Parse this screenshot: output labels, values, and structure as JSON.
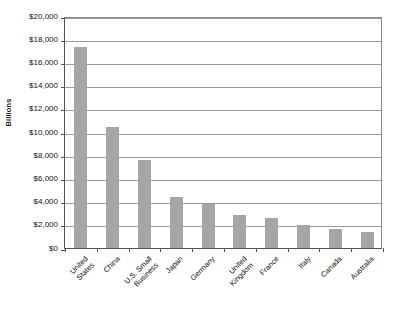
{
  "chart_data": {
    "type": "bar",
    "title": "",
    "xlabel": "",
    "ylabel": "Billions",
    "categories": [
      "United\nStates",
      "China",
      "U.S. Small\nBusiness",
      "Japan",
      "Germany",
      "United\nKingdom",
      "France",
      "Italy",
      "Canada",
      "Australia"
    ],
    "values": [
      17300,
      10400,
      7600,
      4400,
      3800,
      2850,
      2600,
      2000,
      1650,
      1350
    ],
    "ylim": [
      0,
      20000
    ],
    "ytick_values": [
      0,
      2000,
      4000,
      6000,
      8000,
      10000,
      12000,
      14000,
      16000,
      18000,
      20000
    ],
    "ytick_labels": [
      "$0",
      "$2,000",
      "$4,000",
      "$6,000",
      "$8,000",
      "$10,000",
      "$12,000",
      "$14,000",
      "$16,000",
      "$18,000",
      "$20,000"
    ],
    "grid": true,
    "legend": false,
    "bar_color": "#a6a6a6",
    "axis_color": "#555555",
    "gridline_color": "#9a9a9a",
    "background_color": "#ffffff"
  }
}
